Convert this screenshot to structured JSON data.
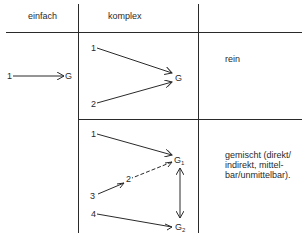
{
  "header": {
    "col_simple": "einfach",
    "col_complex": "komplex",
    "col_desc": ""
  },
  "rows": [
    {
      "simple": {
        "source": "1",
        "target": "G"
      },
      "complex": {
        "sources": [
          "1",
          "2"
        ],
        "target": "G"
      },
      "description": "rein"
    },
    {
      "complex": {
        "sources": [
          "1",
          "3",
          "4"
        ],
        "intermediate": "2",
        "targets": [
          "G1",
          "G2"
        ],
        "target_main": "G",
        "sub1": "1",
        "sub2": "2"
      },
      "description_lines": [
        "gemischt (direkt/",
        "indirekt, mittel-",
        "bar/unmittelbar)."
      ]
    }
  ],
  "colors": {
    "line": "#2a2a2a",
    "background": "#ffffff"
  }
}
